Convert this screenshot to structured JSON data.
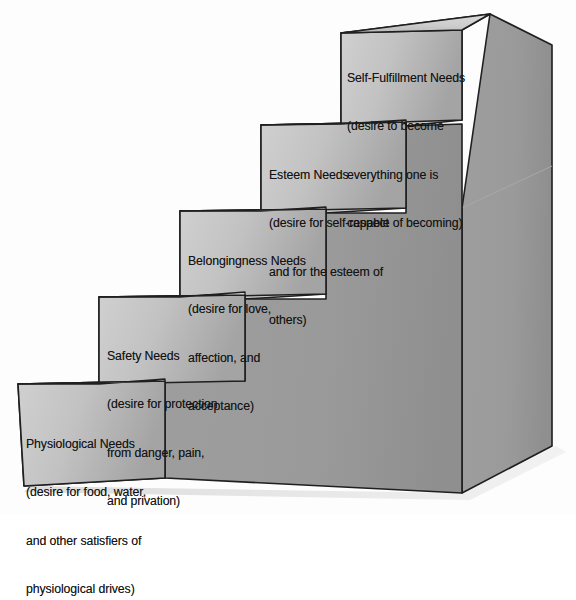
{
  "figure": {
    "name": "maslow-hierarchy-staircase",
    "type": "3d-staircase-diagram",
    "background_color": "#fdfdfd",
    "outline_color": "#1c1c1c",
    "palette": {
      "front_face_light": "#cacaca",
      "front_face_dark": "#a8a8a8",
      "tread_light": "#d2d2d2",
      "tread_dark": "#b4b4b4",
      "side_face": "#9b9b9b",
      "side_face_dark": "#8d8d8d",
      "shadow": "#e8e8e8"
    }
  },
  "steps": [
    {
      "id": "physiological",
      "level": 1,
      "title": "Physiological Needs",
      "desc_lines": [
        "(desire for food, water,",
        "and other satisfiers of",
        "physiological drives)"
      ],
      "label_x": 26,
      "label_y": 404
    },
    {
      "id": "safety",
      "level": 2,
      "title": "Safety Needs",
      "desc_lines": [
        "(desire for protection",
        "from danger, pain,",
        "and privation)"
      ],
      "label_x": 107,
      "label_y": 316
    },
    {
      "id": "belongingness",
      "level": 3,
      "title": "Belongingness Needs",
      "desc_lines": [
        "(desire for love,",
        "affection, and",
        "acceptance)"
      ],
      "label_x": 188,
      "label_y": 221
    },
    {
      "id": "esteem",
      "level": 4,
      "title": "Esteem Needs",
      "desc_lines": [
        "(desire for self-respect",
        "and for the esteem of",
        "others)"
      ],
      "label_x": 269,
      "label_y": 135
    },
    {
      "id": "self-fulfillment",
      "level": 5,
      "title": "Self-Fulfillment Needs",
      "desc_lines": [
        "(desire to become",
        "everything one is",
        "capable of becoming)"
      ],
      "label_x": 347,
      "label_y": 38
    }
  ]
}
